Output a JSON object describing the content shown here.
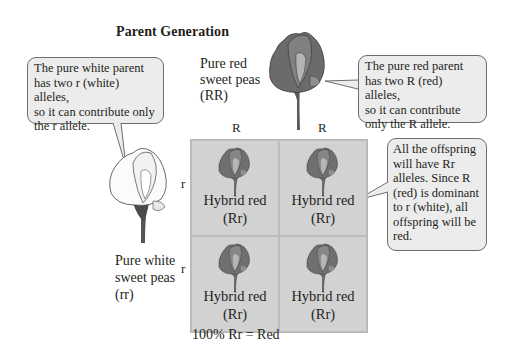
{
  "title": "Parent Generation",
  "red_parent": {
    "label_line1": "Pure red",
    "label_line2": "sweet peas",
    "label_line3": "(RR)",
    "callout": [
      "The pure red parent",
      "has two R (red) alleles,",
      "so it can contribute",
      "only the R allele."
    ]
  },
  "white_parent": {
    "label_line1": "Pure white",
    "label_line2": "sweet peas",
    "label_line3": "(rr)",
    "callout": [
      "The pure white parent",
      "has two r (white) alleles,",
      "so it can contribute only",
      "the r allele."
    ]
  },
  "punnett": {
    "column_alleles": [
      "R",
      "R"
    ],
    "row_alleles": [
      "r",
      "r"
    ],
    "cells": [
      {
        "name": "Hybrid red",
        "genotype": "(Rr)"
      },
      {
        "name": "Hybrid red",
        "genotype": "(Rr)"
      },
      {
        "name": "Hybrid red",
        "genotype": "(Rr)"
      },
      {
        "name": "Hybrid red",
        "genotype": "(Rr)"
      }
    ],
    "result": "100% Rr = Red"
  },
  "offspring_callout": [
    "All the offspring",
    "will have Rr",
    "alleles. Since R",
    "(red) is dominant",
    "to r (white), all",
    "offspring will be",
    "red."
  ],
  "colors": {
    "grid_bg": "#d2d2d2",
    "callout_bg": "#ececec",
    "callout_border": "#6e6e6e",
    "red_flower": "#6b6b6b",
    "white_flower": "#f8f8f8",
    "text": "#231f20"
  }
}
